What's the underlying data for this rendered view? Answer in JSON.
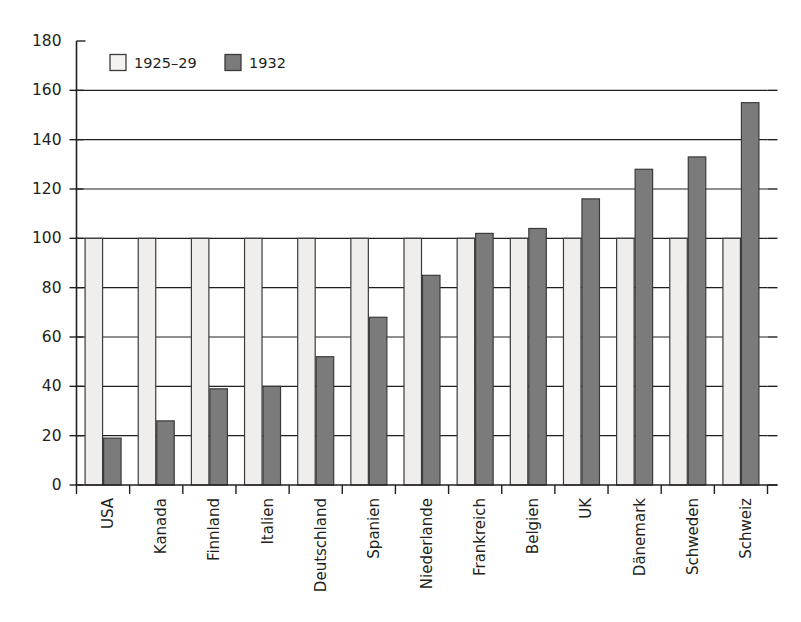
{
  "chart_data": {
    "type": "bar",
    "title": "",
    "subtitle": "",
    "xlabel": "",
    "ylabel": "",
    "ylim": [
      0,
      180
    ],
    "ytick_step": 20,
    "yticks": [
      0,
      20,
      40,
      60,
      80,
      100,
      120,
      140,
      160,
      180
    ],
    "ytick_labels": [
      "0",
      "20",
      "40",
      "60",
      "80",
      "100",
      "120",
      "140",
      "160",
      "180"
    ],
    "grid": "horizontal",
    "legend_position": "top-left",
    "categories": [
      "USA",
      "Kanada",
      "Finnland",
      "Italien",
      "Deutschland",
      "Spanien",
      "Niederlande",
      "Frankreich",
      "Belgien",
      "UK",
      "Dänemark",
      "Schweden",
      "Schweiz"
    ],
    "series": [
      {
        "name": "1925–29",
        "color": "#efeeec",
        "values": [
          100,
          100,
          100,
          100,
          100,
          100,
          100,
          100,
          100,
          100,
          100,
          100,
          100
        ]
      },
      {
        "name": "1932",
        "color": "#7b7b7b",
        "values": [
          19,
          26,
          39,
          40,
          52,
          68,
          85,
          102,
          104,
          116,
          128,
          133,
          155
        ]
      }
    ],
    "legend": [
      {
        "label": "1925–29",
        "swatch": "light"
      },
      {
        "label": "1932",
        "swatch": "dark"
      }
    ],
    "colors": {
      "series_1925_29": "#efeeec",
      "series_1932": "#7b7b7b",
      "axis": "#231f20",
      "grid": "#231f20",
      "background": "#ffffff",
      "bar_outline": "#3b3b3b"
    }
  }
}
